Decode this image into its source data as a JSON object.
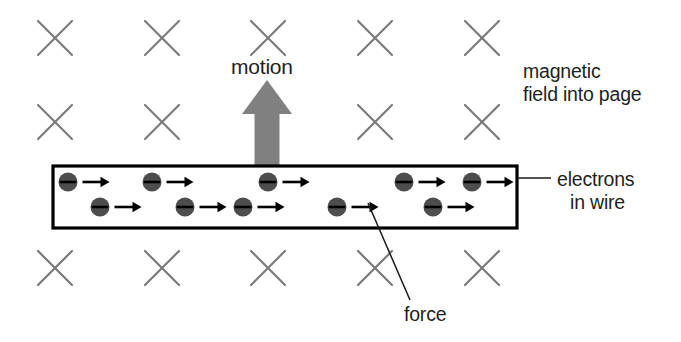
{
  "figure": {
    "type": "physics-diagram",
    "background_color": "#ffffff",
    "width": 681,
    "height": 342
  },
  "labels": {
    "motion": "motion",
    "magnetic_field_line1": "magnetic",
    "magnetic_field_line2": "field into page",
    "electrons_line1": "electrons",
    "electrons_line2": "in wire",
    "force": "force"
  },
  "colors": {
    "text": "#231f20",
    "field_cross": "#7b7b7b",
    "motion_arrow": "#808080",
    "wire_outline": "#000000",
    "electron_fill": "#4d4d4d",
    "electron_sign": "#000000",
    "drift_arrow": "#000000",
    "leader_line": "#1a1a1a"
  },
  "field_crosses": {
    "description": "magnetic field into page symbols",
    "arm_half_length": 17,
    "stroke_width": 2.2,
    "rows": [
      {
        "y": 38,
        "xs": [
          55,
          162,
          268,
          375,
          482
        ]
      },
      {
        "y": 122,
        "xs": [
          55,
          162,
          375,
          482
        ]
      },
      {
        "y": 268,
        "xs": [
          55,
          162,
          268,
          375,
          482
        ]
      }
    ]
  },
  "motion_arrow": {
    "direction": "up",
    "tip_x": 267,
    "tip_y": 80,
    "head_half_width": 25,
    "head_height": 34,
    "shaft_half_width": 12.5,
    "tail_y": 170
  },
  "wire": {
    "x": 53,
    "y": 166,
    "width": 464,
    "height": 62,
    "stroke_width": 3.2
  },
  "electrons": {
    "radius": 9.5,
    "sign": "−",
    "arrow_length": 27,
    "arrow_gap": 5,
    "items": [
      {
        "cx": 68,
        "cy": 182
      },
      {
        "cx": 100,
        "cy": 207
      },
      {
        "cx": 152,
        "cy": 182
      },
      {
        "cx": 185,
        "cy": 207
      },
      {
        "cx": 268,
        "cy": 182
      },
      {
        "cx": 243,
        "cy": 207
      },
      {
        "cx": 404,
        "cy": 182
      },
      {
        "cx": 337,
        "cy": 207
      },
      {
        "cx": 472,
        "cy": 182
      },
      {
        "cx": 433,
        "cy": 207
      }
    ]
  },
  "leaders": [
    {
      "name": "force-leader",
      "x1": 368,
      "y1": 203,
      "x2": 410,
      "y2": 300
    },
    {
      "name": "electrons-leader",
      "x1": 517,
      "y1": 178,
      "x2": 551,
      "y2": 178
    }
  ]
}
